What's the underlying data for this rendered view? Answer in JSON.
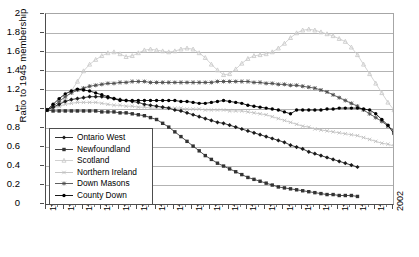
{
  "chart": {
    "type": "line",
    "ylabel": "Ratio to 1945 membership",
    "xlabel": "",
    "title": "",
    "ylim": [
      0,
      2
    ],
    "ytick_labels": [
      "0",
      "0.2",
      "0.4",
      "0.6",
      "0.8",
      "1",
      "1.2",
      "1.4",
      "1.6",
      "1.8",
      "2"
    ],
    "xlim": [
      1945,
      2002
    ],
    "xtick_labels": [
      "1945",
      "1948",
      "1951",
      "1954",
      "1957",
      "1960",
      "1963",
      "1966",
      "1969",
      "1972",
      "1975",
      "1978",
      "1981",
      "1984",
      "1987",
      "1990",
      "1993",
      "1996",
      "1999",
      "2002"
    ],
    "grid": "horizontal",
    "legend_position": "inside-lower-left"
  },
  "legend": {
    "items": [
      {
        "label": "Ontario West",
        "color": "#1a1a1a",
        "marker": "diamond"
      },
      {
        "label": "Newfoundland",
        "color": "#333333",
        "marker": "square"
      },
      {
        "label": "Scotland",
        "color": "#cccccc",
        "marker": "triangle"
      },
      {
        "label": "Northern Ireland",
        "color": "#c0c0c0",
        "marker": "cross"
      },
      {
        "label": "Down Masons",
        "color": "#4d4d4d",
        "marker": "star"
      },
      {
        "label": "County Down",
        "color": "#000000",
        "marker": "circle"
      }
    ]
  },
  "caption": {
    "text": ""
  },
  "chart_data": {
    "type": "line",
    "title": "",
    "xlabel": "",
    "ylabel": "Ratio to 1945 membership",
    "xlim": [
      1945,
      2002
    ],
    "ylim": [
      0,
      2
    ],
    "grid": "horizontal gridlines every 0.2",
    "legend_position": "inside lower-left of plot area",
    "x": [
      1945,
      1946,
      1947,
      1948,
      1949,
      1950,
      1951,
      1952,
      1953,
      1954,
      1955,
      1956,
      1957,
      1958,
      1959,
      1960,
      1961,
      1962,
      1963,
      1964,
      1965,
      1966,
      1967,
      1968,
      1969,
      1970,
      1971,
      1972,
      1973,
      1974,
      1975,
      1976,
      1977,
      1978,
      1979,
      1980,
      1981,
      1982,
      1983,
      1984,
      1985,
      1986,
      1987,
      1988,
      1989,
      1990,
      1991,
      1992,
      1993,
      1994,
      1995,
      1996,
      1997,
      1998,
      1999,
      2000,
      2001,
      2002
    ],
    "series": [
      {
        "name": "Ontario West",
        "color": "#1a1a1a",
        "marker": "diamond",
        "values": [
          1.0,
          1.03,
          1.06,
          1.09,
          1.11,
          1.12,
          1.13,
          1.14,
          1.14,
          1.14,
          1.13,
          1.12,
          1.11,
          1.1,
          1.09,
          1.08,
          1.06,
          1.05,
          1.04,
          1.03,
          1.02,
          1.0,
          0.99,
          0.97,
          0.95,
          0.93,
          0.91,
          0.89,
          0.87,
          0.86,
          0.84,
          0.82,
          0.8,
          0.78,
          0.76,
          0.74,
          0.72,
          0.7,
          0.68,
          0.66,
          0.63,
          0.61,
          0.59,
          0.56,
          0.54,
          0.52,
          0.5,
          0.48,
          0.46,
          0.44,
          0.42,
          0.4,
          null,
          null,
          null,
          null,
          null,
          null
        ]
      },
      {
        "name": "Newfoundland",
        "color": "#333333",
        "marker": "square",
        "values": [
          1.0,
          0.99,
          0.99,
          0.99,
          0.99,
          0.99,
          0.99,
          0.99,
          0.99,
          0.98,
          0.98,
          0.98,
          0.97,
          0.97,
          0.96,
          0.95,
          0.94,
          0.92,
          0.9,
          0.86,
          0.82,
          0.77,
          0.72,
          0.67,
          0.62,
          0.57,
          0.52,
          0.48,
          0.44,
          0.41,
          0.38,
          0.35,
          0.32,
          0.29,
          0.27,
          0.25,
          0.23,
          0.21,
          0.19,
          0.18,
          0.17,
          0.16,
          0.15,
          0.14,
          0.13,
          0.12,
          0.11,
          0.11,
          0.1,
          0.1,
          0.1,
          0.09,
          null,
          null,
          null,
          null,
          null,
          null
        ]
      },
      {
        "name": "Scotland",
        "color": "#cccccc",
        "marker": "triangle",
        "values": [
          1.0,
          1.02,
          1.05,
          1.12,
          1.2,
          1.3,
          1.41,
          1.48,
          1.53,
          1.57,
          1.6,
          1.61,
          1.59,
          1.56,
          1.57,
          1.6,
          1.63,
          1.64,
          1.63,
          1.62,
          1.61,
          1.62,
          1.64,
          1.65,
          1.64,
          1.6,
          1.55,
          1.48,
          1.42,
          1.37,
          1.38,
          1.43,
          1.49,
          1.54,
          1.57,
          1.58,
          1.59,
          1.61,
          1.65,
          1.7,
          1.76,
          1.81,
          1.84,
          1.85,
          1.84,
          1.82,
          1.8,
          1.78,
          1.75,
          1.72,
          1.66,
          1.58,
          1.48,
          1.38,
          1.28,
          1.18,
          1.08,
          1.0
        ]
      },
      {
        "name": "Northern Ireland",
        "color": "#c0c0c0",
        "marker": "cross",
        "values": [
          1.0,
          1.02,
          1.04,
          1.06,
          1.07,
          1.08,
          1.08,
          1.08,
          1.08,
          1.07,
          1.06,
          1.05,
          1.05,
          1.04,
          1.04,
          1.03,
          1.03,
          1.02,
          1.02,
          1.02,
          1.02,
          1.02,
          1.02,
          1.01,
          1.01,
          1.01,
          1.0,
          1.0,
          1.0,
          1.0,
          0.99,
          0.99,
          0.99,
          0.98,
          0.97,
          0.96,
          0.95,
          0.93,
          0.91,
          0.89,
          0.87,
          0.85,
          0.83,
          0.82,
          0.8,
          0.79,
          0.78,
          0.77,
          0.76,
          0.75,
          0.74,
          0.73,
          0.71,
          0.69,
          0.67,
          0.65,
          0.64,
          0.62
        ]
      },
      {
        "name": "Down Masons",
        "color": "#4d4d4d",
        "marker": "star",
        "values": [
          1.0,
          1.04,
          1.09,
          1.14,
          1.18,
          1.21,
          1.23,
          1.25,
          1.26,
          1.27,
          1.28,
          1.28,
          1.29,
          1.29,
          1.3,
          1.3,
          1.3,
          1.29,
          1.29,
          1.29,
          1.29,
          1.29,
          1.29,
          1.29,
          1.29,
          1.29,
          1.29,
          1.29,
          1.3,
          1.3,
          1.3,
          1.3,
          1.3,
          1.3,
          1.29,
          1.29,
          1.28,
          1.28,
          1.27,
          1.27,
          1.26,
          1.26,
          1.25,
          1.24,
          1.23,
          1.21,
          1.19,
          1.16,
          1.13,
          1.1,
          1.07,
          1.04,
          1.0,
          0.96,
          0.92,
          0.88,
          0.83,
          0.78
        ]
      },
      {
        "name": "County Down",
        "color": "#000000",
        "marker": "circle",
        "values": [
          1.0,
          1.06,
          1.12,
          1.17,
          1.2,
          1.22,
          1.21,
          1.2,
          1.18,
          1.16,
          1.14,
          1.12,
          1.1,
          1.1,
          1.1,
          1.1,
          1.1,
          1.1,
          1.1,
          1.1,
          1.1,
          1.1,
          1.09,
          1.09,
          1.08,
          1.07,
          1.07,
          1.08,
          1.09,
          1.1,
          1.09,
          1.08,
          1.07,
          1.05,
          1.04,
          1.03,
          1.02,
          1.01,
          1.0,
          0.98,
          0.96,
          1.0,
          1.0,
          1.0,
          1.0,
          1.0,
          1.01,
          1.01,
          1.02,
          1.02,
          1.02,
          1.02,
          1.01,
          1.0,
          0.96,
          0.9,
          0.84,
          0.75
        ]
      }
    ]
  }
}
